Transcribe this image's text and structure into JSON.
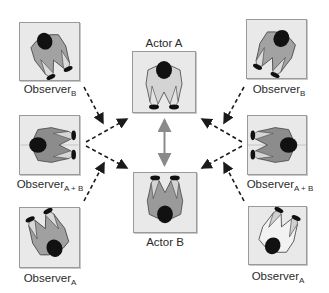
{
  "diagram": {
    "type": "observer-actor interaction diagram",
    "actors": [
      {
        "id": "actor_a",
        "label": "Actor A",
        "facing": "down"
      },
      {
        "id": "actor_b",
        "label": "Actor B",
        "facing": "up"
      }
    ],
    "observers": [
      {
        "id": "obs_b_left",
        "base": "Observer",
        "sub": "B",
        "side": "left",
        "row": "top",
        "target": "Actor A"
      },
      {
        "id": "obs_ab_left",
        "base": "Observer",
        "sub": "A + B",
        "side": "left",
        "row": "middle",
        "target": "Actor A, Actor B"
      },
      {
        "id": "obs_a_left",
        "base": "Observer",
        "sub": "A",
        "side": "left",
        "row": "bottom",
        "target": "Actor B"
      },
      {
        "id": "obs_b_right",
        "base": "Observer",
        "sub": "B",
        "side": "right",
        "row": "top",
        "target": "Actor A"
      },
      {
        "id": "obs_ab_right",
        "base": "Observer",
        "sub": "A + B",
        "side": "right",
        "row": "middle",
        "target": "Actor A, Actor B"
      },
      {
        "id": "obs_a_right",
        "base": "Observer",
        "sub": "A",
        "side": "right",
        "row": "bottom",
        "target": "Actor B"
      }
    ],
    "connections": {
      "actor_link": "Actor A <-> Actor B (solid gray double-headed arrow)",
      "observer_links": "dashed black arrows from observers toward actors"
    },
    "colors": {
      "box_bg": "#e9e9e9",
      "box_border": "#9a9a9a",
      "shirt_gray": "#9c9c9c",
      "shirt_light": "#d9d9d9",
      "head": "#111111",
      "arrow_dashed": "#1a1a1a",
      "arrow_solid": "#8a8a8a"
    }
  }
}
